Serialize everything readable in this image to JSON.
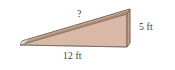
{
  "figure": {
    "background_color": "#ffffff",
    "labels": {
      "hypotenuse": "?",
      "height": "5 ft",
      "base": "12 ft"
    },
    "colors": {
      "front_face": "#d9b9a6",
      "top_face": "#b58a72",
      "top_face_highlight": "#c9a189",
      "end_face": "#d3ad97",
      "side_strip": "#a87b63",
      "outline": "#6f6a66",
      "label_color": "#3a3a3a"
    },
    "geometry": {
      "front_face_points": "20,45 127,47 127,14",
      "top_face_points": "20,45 22,41 130,9 127,14",
      "end_face_points": "127,14 130,9 130,43 127,47",
      "base_edge_points": "20,45 127,47",
      "hypotenuse_edge_points": "22,41 130,9",
      "vertical_edge_points": "127,14 127,47"
    }
  }
}
